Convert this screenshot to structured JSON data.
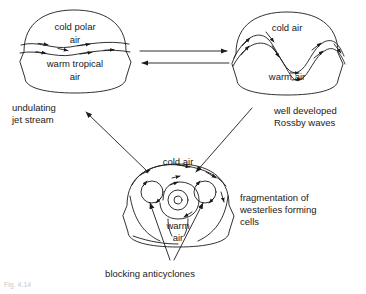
{
  "figure": {
    "type": "meteorological process diagram",
    "stroke_color": "#1a1a1a",
    "background": "#ffffff",
    "faint_caption": "Fig. 4.14"
  },
  "panels": [
    {
      "id": "panel-undulating",
      "position": "top-left",
      "inner_labels": [
        "cold polar",
        "air",
        "warm tropical",
        "air"
      ],
      "caption": [
        "undulating",
        "jet stream"
      ]
    },
    {
      "id": "panel-rossby",
      "position": "top-right",
      "inner_labels": [
        "cold air",
        "warm air"
      ],
      "caption": [
        "well developed",
        "Rossby waves"
      ]
    },
    {
      "id": "panel-cells",
      "position": "bottom-center",
      "inner_labels": [
        "cold air",
        "warm",
        "air"
      ],
      "caption": [
        "fragmentation of",
        "westerlies forming",
        "cells"
      ],
      "pointer_caption": "blocking anticyclones"
    }
  ],
  "text": {
    "cold_polar": "cold polar",
    "air": "air",
    "warm_tropical": "warm tropical",
    "air2": "air",
    "cold_air_tr": "cold air",
    "warm_air_tr": "warm air",
    "cold_air_b": "cold air",
    "warm_b": "warm",
    "air_b": "air",
    "cap_undulating_1": "undulating",
    "cap_undulating_2": "jet stream",
    "cap_rossby_1": "well developed",
    "cap_rossby_2": "Rossby waves",
    "cap_frag_1": "fragmentation of",
    "cap_frag_2": "westerlies forming",
    "cap_frag_3": "cells",
    "cap_blocking": "blocking anticyclones",
    "faint": "Fig. 4.14"
  },
  "connectors": [
    {
      "name": "arrow-left-to-right",
      "direction": "right"
    },
    {
      "name": "arrow-right-to-left",
      "direction": "left"
    },
    {
      "name": "arrow-rossby-to-cells",
      "direction": "down-left"
    },
    {
      "name": "arrow-cells-to-undulating",
      "direction": "up-left"
    },
    {
      "name": "pointer-blocking-left",
      "direction": "up-left"
    },
    {
      "name": "pointer-blocking-right",
      "direction": "up-right"
    }
  ]
}
